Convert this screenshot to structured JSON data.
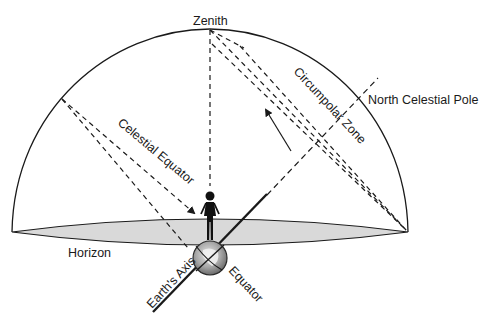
{
  "diagram": {
    "labels": {
      "zenith": "Zenith",
      "north_celestial_pole": "North Celestial Pole",
      "circumpolar_zone": "Circumpolar Zone",
      "celestial_equator": "Celestial Equator",
      "horizon": "Horizon",
      "earths_axis": "Earth's Axis",
      "equator": "Equator"
    },
    "colors": {
      "line": "#1a1a1a",
      "horizon_fill": "#d9d9d9",
      "globe_fill": "#b8b8b8",
      "background": "#ffffff"
    }
  }
}
